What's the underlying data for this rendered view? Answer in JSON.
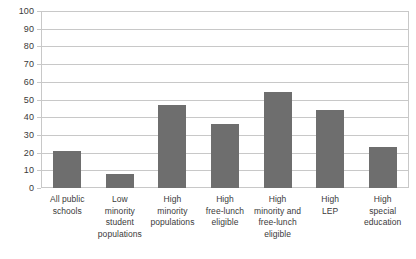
{
  "chart_data": {
    "type": "bar",
    "title": "",
    "subtitle": "",
    "xlabel": "",
    "ylabel": "",
    "ylim": [
      0,
      100
    ],
    "ytick_step": 10,
    "yticks": [
      "100",
      "90",
      "80",
      "70",
      "60",
      "50",
      "40",
      "30",
      "20",
      "10",
      "0"
    ],
    "grid": true,
    "legend": "none",
    "bar_color": "#6e6e6e",
    "plot_border_color": "#c8c8c8",
    "gridline_color": "#c8c8c8",
    "categories": [
      "All public schools",
      "Low minority student populations",
      "High minority populations",
      "High free-lunch eligible",
      "High minority and free-lunch eligible",
      "High LEP",
      "High special education"
    ],
    "category_lines": [
      [
        "All public",
        "schools"
      ],
      [
        "Low",
        "minority",
        "student",
        "populations"
      ],
      [
        "High",
        "minority",
        "populations"
      ],
      [
        "High",
        "free-lunch",
        "eligible"
      ],
      [
        "High",
        "minority and",
        "free-lunch",
        "eligible"
      ],
      [
        "High",
        "LEP"
      ],
      [
        "High",
        "special",
        "education"
      ]
    ],
    "values": [
      21,
      8,
      47,
      36,
      54,
      44,
      23
    ]
  }
}
